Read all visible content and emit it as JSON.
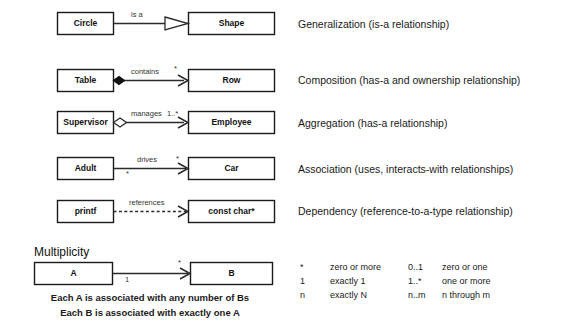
{
  "relationships": [
    {
      "source": "Circle",
      "target": "Shape",
      "edge_label": "is a",
      "source_mult": "",
      "target_mult": "",
      "description": "Generalization (is-a relationship)",
      "arrow": "hollow-triangle",
      "line": "solid",
      "end_decoration": "none"
    },
    {
      "source": "Table",
      "target": "Row",
      "edge_label": "contains",
      "source_mult": "",
      "target_mult": "*",
      "description": "Composition (has-a and ownership relationship)",
      "arrow": "open",
      "line": "solid",
      "end_decoration": "filled-diamond"
    },
    {
      "source": "Supervisor",
      "target": "Employee",
      "edge_label": "manages",
      "source_mult": "",
      "target_mult": "1..*",
      "description": "Aggregation (has-a relationship)",
      "arrow": "open",
      "line": "solid",
      "end_decoration": "hollow-diamond"
    },
    {
      "source": "Adult",
      "target": "Car",
      "edge_label": "drives",
      "source_mult": "*",
      "target_mult": "*",
      "description": "Association (uses, interacts-with relationships)",
      "arrow": "open",
      "line": "solid",
      "end_decoration": "none"
    },
    {
      "source": "printf",
      "target": "const char*",
      "edge_label": "references",
      "source_mult": "",
      "target_mult": "",
      "description": "Dependency (reference-to-a-type relationship)",
      "arrow": "open",
      "line": "dashed",
      "end_decoration": "none"
    }
  ],
  "multiplicity": {
    "title": "Multiplicity",
    "source": "A",
    "target": "B",
    "source_mult": "1",
    "target_mult": "*",
    "captions": [
      "Each A is associated with any number of Bs",
      "Each B is associated with exactly one A"
    ],
    "legend": [
      {
        "symbol": "*",
        "meaning": "zero or more",
        "symbol2": "0..1",
        "meaning2": "zero or one"
      },
      {
        "symbol": "1",
        "meaning": "exactly 1",
        "symbol2": "1..*",
        "meaning2": "one or more"
      },
      {
        "symbol": "n",
        "meaning": "exactly N",
        "symbol2": "n..m",
        "meaning2": "n through m"
      }
    ]
  },
  "colors": {
    "stroke": "#2b2b2b",
    "box_fill": "#ffffff",
    "text": "#1a1a1a",
    "diamond_filled": "#111111"
  }
}
